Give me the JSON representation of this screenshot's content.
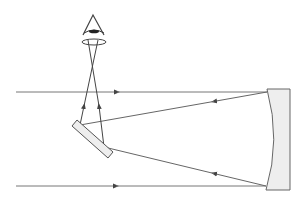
{
  "diagram": {
    "title": "",
    "colors": {
      "line": "#555555",
      "mirror_fill": "#eeeeee",
      "mirror_stroke": "#666666",
      "eye": "#333333"
    },
    "components": [
      {
        "id": "eye",
        "label": "",
        "shape": "triangle-eye",
        "apex": [
          93,
          15
        ],
        "base_y": 34,
        "base_x": [
          83,
          104
        ]
      },
      {
        "id": "eyepiece-lens",
        "label": "",
        "shape": "ellipse",
        "center": [
          94,
          42
        ],
        "rx": 12,
        "ry": 3
      },
      {
        "id": "flat-mirror",
        "label": "",
        "shape": "tilted-rect",
        "from": [
          75,
          122
        ],
        "to": [
          110,
          155
        ]
      },
      {
        "id": "concave-mirror",
        "label": "",
        "shape": "concave-block",
        "top": 89,
        "bottom": 190,
        "left": 267,
        "right": 290
      }
    ],
    "rays": [
      {
        "id": "incoming-upper",
        "from": [
          16,
          92
        ],
        "to": [
          267,
          92
        ],
        "arrow": "right"
      },
      {
        "id": "incoming-lower",
        "from": [
          16,
          186
        ],
        "to": [
          266,
          186
        ],
        "arrow": "right"
      },
      {
        "id": "reflected-upper",
        "from": [
          267,
          92
        ],
        "to": [
          80,
          125
        ],
        "arrow": "left"
      },
      {
        "id": "reflected-lower",
        "from": [
          266,
          186
        ],
        "to": [
          104,
          147
        ],
        "arrow": "left"
      },
      {
        "id": "to-eye-left",
        "from": [
          80,
          125
        ],
        "to": [
          98,
          40
        ],
        "arrow": "up"
      },
      {
        "id": "to-eye-right",
        "from": [
          104,
          147
        ],
        "to": [
          88,
          40
        ],
        "arrow": "up"
      }
    ]
  }
}
